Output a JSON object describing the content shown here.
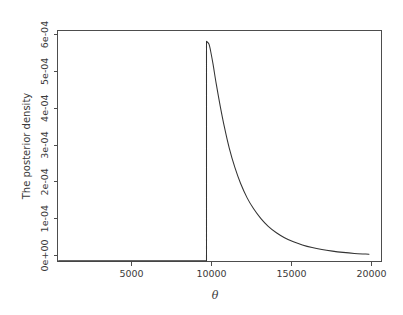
{
  "figure": {
    "background_color": "#ffffff",
    "width": 403,
    "height": 315
  },
  "chart_data": {
    "type": "line",
    "title": "",
    "xlabel": "θ",
    "ylabel": "The posterior density",
    "xlim": [
      800,
      20800
    ],
    "ylim": [
      0,
      0.000615
    ],
    "grid": false,
    "legend": null,
    "axis_color": "#4d4d4d",
    "line_color": "#333333",
    "xticks": [
      5000,
      10000,
      15000,
      20000
    ],
    "xticklabels": [
      "5000",
      "10000",
      "15000",
      "20000"
    ],
    "yticks": [
      0,
      0.0001,
      0.0002,
      0.0003,
      0.0004,
      0.0005,
      0.0006
    ],
    "yticklabels": [
      "0e+00",
      "1e-04",
      "2e-04",
      "3e-04",
      "4e-04",
      "5e-04",
      "6e-04"
    ],
    "annotations": [
      {
        "label": "threshold",
        "x": 10000,
        "y": 0
      },
      {
        "label": "peak",
        "x": 10250,
        "y": 0.000585
      }
    ],
    "series": [
      {
        "name": "posterior density",
        "x": [
          900,
          1500,
          2500,
          3500,
          4500,
          5500,
          6500,
          7500,
          8500,
          9500,
          9990,
          10000,
          10150,
          10250,
          10400,
          10600,
          10850,
          11100,
          11400,
          11750,
          12100,
          12500,
          12900,
          13350,
          13800,
          14300,
          14800,
          15350,
          15900,
          16500,
          17100,
          17750,
          18400,
          19100,
          19800,
          20000
        ],
        "y": [
          3.5e-06,
          3.5e-06,
          3.5e-06,
          3.5e-06,
          3.5e-06,
          3.5e-06,
          3.5e-06,
          3.5e-06,
          3.5e-06,
          3.5e-06,
          3.5e-06,
          0.000585,
          0.000578,
          0.00056,
          0.000525,
          0.000472,
          0.000412,
          0.000358,
          0.000302,
          0.00025,
          0.000208,
          0.00017,
          0.000141,
          0.000115,
          9.45e-05,
          7.75e-05,
          6.45e-05,
          5.35e-05,
          4.52e-05,
          3.82e-05,
          3.3e-05,
          2.88e-05,
          2.55e-05,
          2.28e-05,
          2.1e-05,
          2.05e-05
        ]
      }
    ]
  },
  "geometry": {
    "plot_left": 57,
    "plot_right": 382,
    "plot_top": 30,
    "plot_bottom": 262,
    "x_pixel_per_unit": 0.016,
    "y_pixel_per_unit": 368333
  }
}
